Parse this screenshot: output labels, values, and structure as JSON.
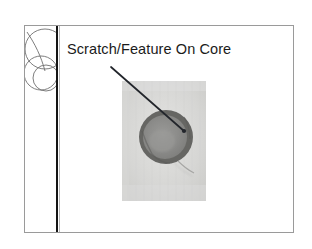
{
  "document": {
    "type": "presentation-slide",
    "page_background": "#ffffff"
  },
  "slide": {
    "title": "Scratch/Feature On Core",
    "title_color": "#1b1b1b",
    "frame_border_color": "#9a9a9a",
    "background": "#ffffff",
    "decoration": {
      "name": "overlapping-circles-motif",
      "stroke_color": "#6f6f6f",
      "description": "three overlapping outlined circles clipped by the left band"
    },
    "divider": {
      "name": "vertical-rule",
      "color": "#151515"
    },
    "annotation": {
      "leader_line_color": "#22252b",
      "endpoint_marker": "dot",
      "points_to": "center of core"
    },
    "figure": {
      "caption": "",
      "alt": "Grayscale micrograph of a circular fiber core with a darker annular ring and a scratch feature",
      "background_color": "#d8d8d6",
      "core_ring_color": "#6e6e6e",
      "core_fill_color": "#8b8b8b"
    }
  }
}
